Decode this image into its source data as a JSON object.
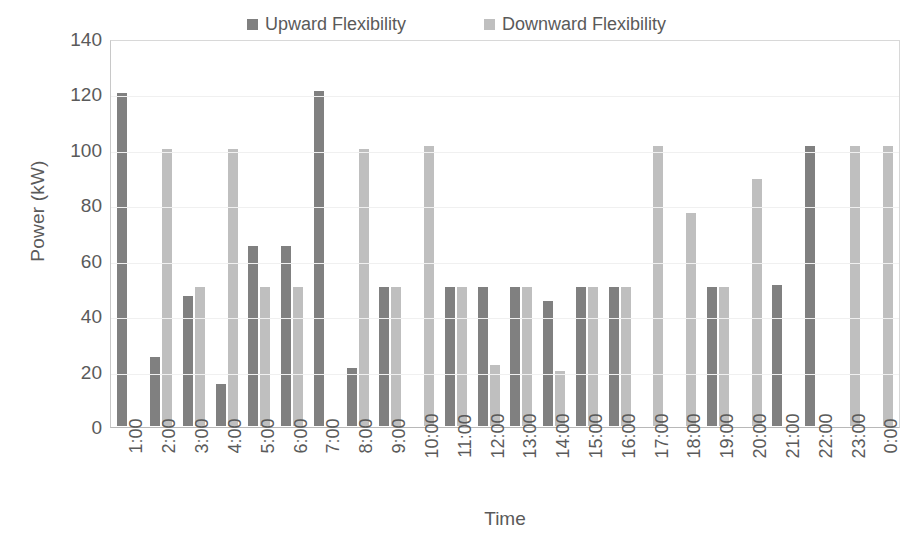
{
  "chart_data": {
    "type": "bar",
    "title": "",
    "xlabel": "Time",
    "ylabel": "Power (kW)",
    "ylim": [
      0,
      140
    ],
    "yticks": [
      0,
      20,
      40,
      60,
      80,
      100,
      120,
      140
    ],
    "grid": true,
    "legend_position": "top-center",
    "categories": [
      "1:00",
      "2:00",
      "3:00",
      "4:00",
      "5:00",
      "6:00",
      "7:00",
      "8:00",
      "9:00",
      "10:00",
      "11:00",
      "12:00",
      "13:00",
      "14:00",
      "15:00",
      "16:00",
      "17:00",
      "18:00",
      "19:00",
      "20:00",
      "21:00",
      "22:00",
      "23:00",
      "0:00"
    ],
    "series": [
      {
        "name": "Upward Flexibility",
        "color": "#808080",
        "values": [
          120,
          25,
          47,
          15,
          65,
          65,
          121,
          21,
          50,
          0,
          50,
          50,
          50,
          45,
          50,
          50,
          0,
          0,
          50,
          0,
          51,
          101,
          0,
          0
        ]
      },
      {
        "name": "Downward Flexibility",
        "color": "#bfbfbf",
        "values": [
          0,
          100,
          50,
          100,
          50,
          50,
          0,
          100,
          50,
          101,
          50,
          22,
          50,
          20,
          50,
          50,
          101,
          77,
          50,
          89,
          0,
          0,
          101,
          101
        ]
      }
    ]
  },
  "axes": {
    "y_title": "Power (kW)",
    "x_title": "Time"
  },
  "legend": {
    "items": [
      {
        "label": "Upward Flexibility",
        "color": "#808080"
      },
      {
        "label": "Downward Flexibility",
        "color": "#bfbfbf"
      }
    ]
  }
}
